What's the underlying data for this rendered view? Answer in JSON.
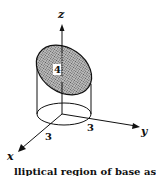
{
  "figure": {
    "axes": {
      "x": "x",
      "y": "y",
      "z": "z"
    },
    "labels": {
      "height": "4",
      "radius_x": "3",
      "radius_y": "3"
    },
    "caption": "lliptical region of base as its"
  },
  "colors": {
    "ink": "#111111",
    "shade": "#9a9a9a",
    "background": "#ffffff"
  }
}
